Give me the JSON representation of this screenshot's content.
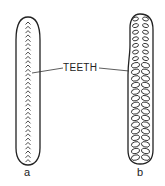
{
  "diagram": {
    "label_center": "TEETH",
    "panels": [
      {
        "id": "a",
        "label": "a",
        "tooth_shape": "chevron"
      },
      {
        "id": "b",
        "label": "b",
        "tooth_shape": "oval"
      }
    ],
    "stroke_color": "#222222"
  }
}
